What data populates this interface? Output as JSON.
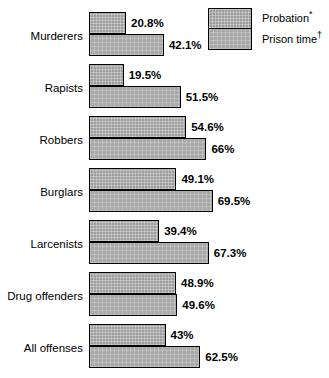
{
  "legend": {
    "items": [
      {
        "key": "probation",
        "label": "Probation",
        "marker": "*",
        "swatch_name": "legend-swatch-probation"
      },
      {
        "key": "prison",
        "label": "Prison time",
        "marker": "†",
        "swatch_name": "legend-swatch-prison-time"
      }
    ]
  },
  "chart_data": {
    "type": "bar",
    "orientation": "horizontal",
    "grouped": true,
    "title": "",
    "subtitle": "",
    "xlabel": "",
    "ylabel": "",
    "xlim": [
      0,
      70
    ],
    "grid": false,
    "legend_position": "top-right",
    "units": "percent",
    "categories": [
      "Murderers",
      "Rapists",
      "Robbers",
      "Burglars",
      "Larcenists",
      "Drug offenders",
      "All offenses"
    ],
    "series": [
      {
        "name": "Probation*",
        "key": "probation",
        "values": [
          20.8,
          19.5,
          54.6,
          49.1,
          39.4,
          48.9,
          43
        ],
        "labels": [
          "20.8%",
          "19.5%",
          "54.6%",
          "49.1%",
          "39.4%",
          "48.9%",
          "43%"
        ],
        "color": "#9d9d9d"
      },
      {
        "name": "Prison time†",
        "key": "prison",
        "values": [
          42.1,
          51.5,
          66,
          69.5,
          67.3,
          49.6,
          62.5
        ],
        "labels": [
          "42.1%",
          "51.5%",
          "66%",
          "69.5%",
          "67.3%",
          "49.6%",
          "62.5%"
        ],
        "color": "#a8a8a8"
      }
    ],
    "rows": [
      {
        "category": "Murderers",
        "probation": 20.8,
        "probation_label": "20.8%",
        "prison": 42.1,
        "prison_label": "42.1%"
      },
      {
        "category": "Rapists",
        "probation": 19.5,
        "probation_label": "19.5%",
        "prison": 51.5,
        "prison_label": "51.5%"
      },
      {
        "category": "Robbers",
        "probation": 54.6,
        "probation_label": "54.6%",
        "prison": 66,
        "prison_label": "66%"
      },
      {
        "category": "Burglars",
        "probation": 49.1,
        "probation_label": "49.1%",
        "prison": 69.5,
        "prison_label": "69.5%"
      },
      {
        "category": "Larcenists",
        "probation": 39.4,
        "probation_label": "39.4%",
        "prison": 67.3,
        "prison_label": "67.3%"
      },
      {
        "category": "Drug offenders",
        "probation": 48.9,
        "probation_label": "48.9%",
        "prison": 49.6,
        "prison_label": "49.6%"
      },
      {
        "category": "All offenses",
        "probation": 43,
        "probation_label": "43%",
        "prison": 62.5,
        "prison_label": "62.5%"
      }
    ]
  },
  "scale": {
    "px_per_percent": 1.78
  }
}
